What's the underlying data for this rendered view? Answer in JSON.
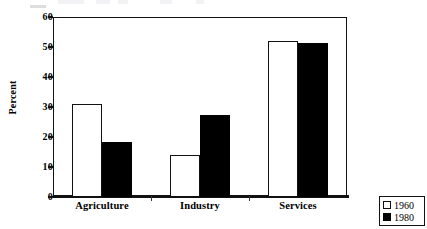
{
  "chart_data": {
    "type": "bar",
    "title": "",
    "xlabel": "",
    "ylabel": "Percent",
    "categories": [
      "Agriculture",
      "Industry",
      "Services"
    ],
    "series": [
      {
        "name": "1960",
        "values": [
          31,
          14,
          52
        ],
        "style": "open",
        "color": "#ffffff"
      },
      {
        "name": "1980",
        "values": [
          18.5,
          27.5,
          51.5
        ],
        "style": "filled",
        "color": "#000000"
      }
    ],
    "ylim": [
      0,
      60
    ],
    "ytick_values": [
      60,
      50,
      40,
      30,
      20,
      10,
      0
    ],
    "ytick_labels": [
      "60",
      "50",
      "40",
      "30",
      "20",
      "10",
      "0"
    ],
    "ytick_step": 10,
    "grid": false,
    "legend_position": "bottom-right-outside",
    "frame": "box"
  },
  "axis": {
    "y_label": "Percent"
  },
  "legend": {
    "entries": [
      {
        "label": "1960",
        "swatch": "open-square-icon"
      },
      {
        "label": "1980",
        "swatch": "filled-square-icon"
      }
    ]
  },
  "colors": {
    "series_1960": "#ffffff",
    "series_1980": "#000000",
    "axis": "#111111",
    "background": "#ffffff"
  }
}
